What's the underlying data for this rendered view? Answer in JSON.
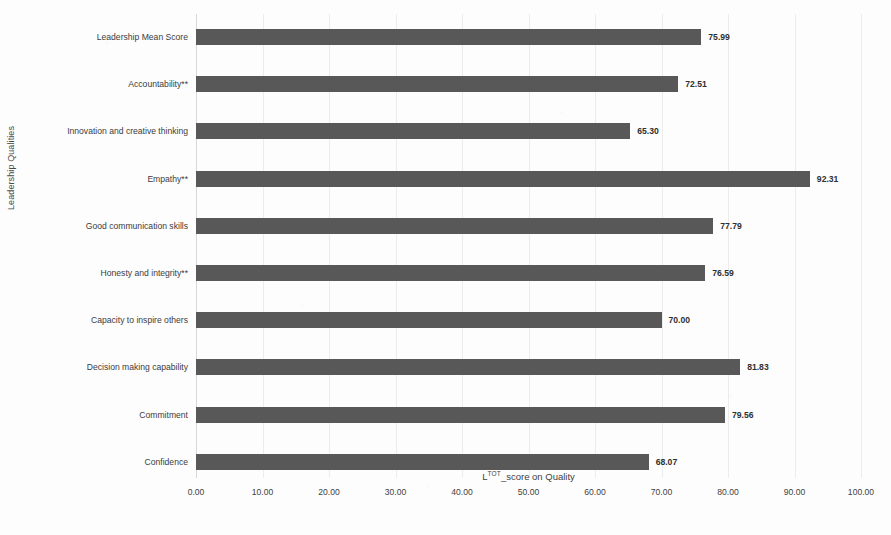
{
  "chart_data": {
    "type": "bar",
    "orientation": "horizontal",
    "title": "",
    "xlabel": "L",
    "xlabel_sup": "TOT",
    "xlabel_rest": "_score on Quality",
    "xlabel_full": "LTOT_score on Quality",
    "ylabel": "Leadership Qualities",
    "xlim": [
      0,
      100
    ],
    "grid": true,
    "legend": "none",
    "bar_color": "#585858",
    "gridline_color": "#ececec",
    "categories": [
      "Leadership Mean Score",
      "Accountability**",
      "Innovation and creative thinking",
      "Empathy**",
      "Good communication skills",
      "Honesty and integrity**",
      "Capacity to inspire others",
      "Decision making capability",
      "Commitment",
      "Confidence"
    ],
    "values": [
      75.99,
      72.51,
      65.3,
      92.31,
      77.79,
      76.59,
      70.0,
      81.83,
      79.56,
      68.07
    ],
    "value_labels": [
      "75.99",
      "72.51",
      "65.30",
      "92.31",
      "77.79",
      "76.59",
      "70.00",
      "81.83",
      "79.56",
      "68.07"
    ],
    "xticks": [
      0,
      10,
      20,
      30,
      40,
      50,
      60,
      70,
      80,
      90,
      100
    ],
    "xtick_labels": [
      "0.00",
      "10.00",
      "20.00",
      "30.00",
      "40.00",
      "50.00",
      "60.00",
      "70.00",
      "80.00",
      "90.00",
      "100.00"
    ]
  }
}
